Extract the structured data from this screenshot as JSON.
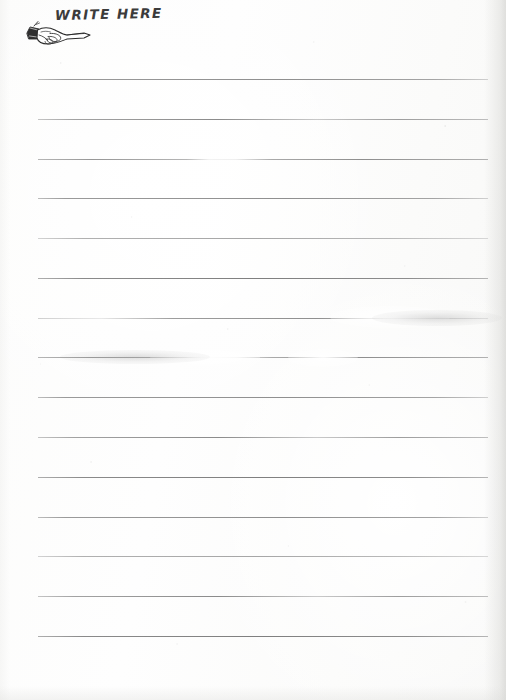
{
  "page": {
    "name": "ruled-notepaper-scan",
    "width": 506,
    "height": 700,
    "background_color": "#fdfdfc",
    "paper_tone": "#fbfbfa"
  },
  "header": {
    "title": "WRITE HERE",
    "title_color": "#3b3b3b",
    "icon_name": "pointing-hand-icon",
    "icon_color": "#2b2b2b",
    "icon_description": "manicule pointing hand with shirt cuff, index finger pointing right"
  },
  "rules": {
    "count": 15,
    "color": "#9b9b9b",
    "thickness_px": 1,
    "left_px": 38,
    "right_px": 488,
    "spacing_px": 39.7,
    "lines": [
      {
        "index": 1,
        "y": 79,
        "left": 38,
        "width": 450,
        "style": "fade-soft"
      },
      {
        "index": 2,
        "y": 119,
        "left": 38,
        "width": 450,
        "style": "fade-mid"
      },
      {
        "index": 3,
        "y": 159,
        "left": 38,
        "width": 450,
        "style": "fade-break"
      },
      {
        "index": 4,
        "y": 198,
        "left": 38,
        "width": 450,
        "style": "fade-soft"
      },
      {
        "index": 5,
        "y": 238,
        "left": 38,
        "width": 450,
        "style": "fade-light"
      },
      {
        "index": 6,
        "y": 278,
        "left": 38,
        "width": 450,
        "style": "fade-heavy"
      },
      {
        "index": 7,
        "y": 318,
        "left": 38,
        "width": 450,
        "style": "fade-wash"
      },
      {
        "index": 8,
        "y": 357,
        "left": 38,
        "width": 450,
        "style": "fade-break"
      },
      {
        "index": 9,
        "y": 397,
        "left": 38,
        "width": 450,
        "style": "fade-soft"
      },
      {
        "index": 10,
        "y": 437,
        "left": 38,
        "width": 450,
        "style": "fade-mid"
      },
      {
        "index": 11,
        "y": 477,
        "left": 38,
        "width": 450,
        "style": "fade-heavy"
      },
      {
        "index": 12,
        "y": 517,
        "left": 38,
        "width": 450,
        "style": "fade-soft"
      },
      {
        "index": 13,
        "y": 556,
        "left": 38,
        "width": 450,
        "style": "fade-light"
      },
      {
        "index": 14,
        "y": 596,
        "left": 38,
        "width": 450,
        "style": "fade-mid"
      },
      {
        "index": 15,
        "y": 636,
        "left": 38,
        "width": 450,
        "style": "fade-heavy"
      }
    ]
  },
  "artifacts": {
    "right_edge_shadow": true,
    "bottom_edge_shadow": true,
    "left_edge_shadow": true,
    "speckle": true
  }
}
